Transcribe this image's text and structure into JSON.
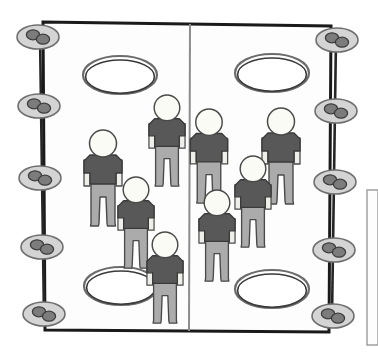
{
  "scene": {
    "title": "Gym Court Activity Diagram",
    "description": "Top-down schematic of a rectangular court divided by a center line, with four hoops, ten edge markers, and eight player figures",
    "background_color": "#ffffff"
  },
  "court": {
    "name": "court-outline",
    "x": 43,
    "y": 22,
    "width": 288,
    "height": 310,
    "stroke_color": "#1a1a1a",
    "stroke_width": 3,
    "fill_color": "#fdfdfd",
    "corners": {
      "top_left": [
        43,
        22
      ],
      "top_right": [
        331,
        26
      ],
      "bottom_right": [
        329,
        332
      ],
      "bottom_left": [
        45,
        330
      ]
    }
  },
  "center_line": {
    "name": "center-divider-line",
    "x1": 190,
    "y1": 24,
    "x2": 189,
    "y2": 331,
    "stroke_color": "#8c8c8c",
    "stroke_width": 2
  },
  "hoops": {
    "outer_stroke_color": "#6b6b6b",
    "inner_stroke_color": "#3a3a3a",
    "fill_color": "#ffffff",
    "count": 4,
    "items": [
      {
        "label": "hoop-top-left",
        "cx": 120,
        "cy": 75,
        "rx": 37,
        "ry": 19
      },
      {
        "label": "hoop-top-right",
        "cx": 272,
        "cy": 73,
        "rx": 37,
        "ry": 19
      },
      {
        "label": "hoop-bottom-left",
        "cx": 121,
        "cy": 286,
        "rx": 37,
        "ry": 19
      },
      {
        "label": "hoop-bottom-right",
        "cx": 272,
        "cy": 289,
        "rx": 37,
        "ry": 19
      }
    ]
  },
  "edge_markers": {
    "oval_fill_color": "#d4d4d4",
    "oval_stroke_color": "#6f6f6f",
    "blob_fill_color": "#7c7c7c",
    "blob_stroke_color": "#3d3d3d",
    "rope_color": "#262626",
    "count": 10,
    "left": {
      "label": "left-marker-rope",
      "rope": {
        "x1": 40,
        "y1": 34,
        "x2": 44,
        "y2": 318
      },
      "items": [
        {
          "label": "left-marker-1",
          "cx": 38,
          "cy": 37,
          "rx": 21,
          "ry": 12
        },
        {
          "label": "left-marker-2",
          "cx": 39,
          "cy": 106,
          "rx": 21,
          "ry": 12
        },
        {
          "label": "left-marker-3",
          "cx": 40,
          "cy": 178,
          "rx": 21,
          "ry": 12
        },
        {
          "label": "left-marker-4",
          "cx": 42,
          "cy": 247,
          "rx": 21,
          "ry": 12
        },
        {
          "label": "left-marker-5",
          "cx": 44,
          "cy": 314,
          "rx": 21,
          "ry": 12
        }
      ]
    },
    "right": {
      "label": "right-marker-rope",
      "rope": {
        "x1": 336,
        "y1": 38,
        "x2": 332,
        "y2": 318
      },
      "items": [
        {
          "label": "right-marker-1",
          "cx": 337,
          "cy": 40,
          "rx": 21,
          "ry": 12
        },
        {
          "label": "right-marker-2",
          "cx": 336,
          "cy": 111,
          "rx": 21,
          "ry": 12
        },
        {
          "label": "right-marker-3",
          "cx": 335,
          "cy": 182,
          "rx": 21,
          "ry": 12
        },
        {
          "label": "right-marker-4",
          "cx": 334,
          "cy": 250,
          "rx": 21,
          "ry": 12
        },
        {
          "label": "right-marker-5",
          "cx": 333,
          "cy": 316,
          "rx": 21,
          "ry": 12
        }
      ]
    }
  },
  "figures": {
    "head_fill_color": "#fbfbf6",
    "head_stroke_color": "#4a4a4a",
    "shirt_fill_color": "#585858",
    "shirt_stroke_color": "#3a3a3a",
    "pants_fill_color": "#ababab",
    "pants_stroke_color": "#4a4a4a",
    "count": 8,
    "left_team_count": 4,
    "right_team_count": 4,
    "items": [
      {
        "label": "figure-left-1",
        "side": "left",
        "x": 103,
        "y": 130,
        "scale": 1.0
      },
      {
        "label": "figure-left-2",
        "side": "left",
        "x": 167,
        "y": 95,
        "scale": 0.95
      },
      {
        "label": "figure-left-3",
        "side": "left",
        "x": 136,
        "y": 177,
        "scale": 0.95
      },
      {
        "label": "figure-left-4",
        "side": "left",
        "x": 165,
        "y": 232,
        "scale": 0.95
      },
      {
        "label": "figure-right-1",
        "side": "right",
        "x": 209,
        "y": 109,
        "scale": 0.98
      },
      {
        "label": "figure-right-2",
        "side": "right",
        "x": 281,
        "y": 108,
        "scale": 1.0
      },
      {
        "label": "figure-right-3",
        "side": "right",
        "x": 253,
        "y": 156,
        "scale": 0.95
      },
      {
        "label": "figure-right-4",
        "side": "right",
        "x": 217,
        "y": 190,
        "scale": 0.95
      }
    ]
  },
  "side_panel": {
    "label": "right-edge-panel",
    "x": 367,
    "y": 190,
    "width": 11,
    "height": 155,
    "stroke_color": "#9a9a9a",
    "fill_color": "#fdfdfd"
  }
}
